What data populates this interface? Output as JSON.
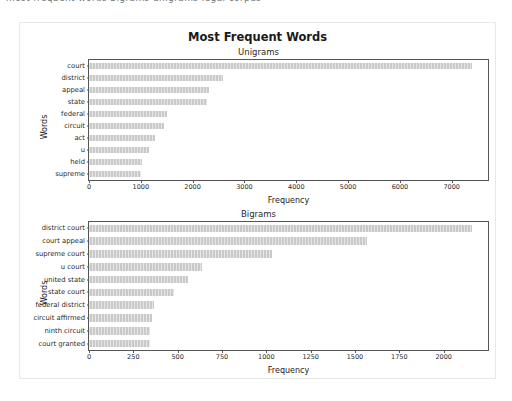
{
  "top_strip": {
    "clipped_text": "most frequent words bigrams unigrams legal corpus"
  },
  "figure": {
    "title": "Most Frequent Words",
    "background": "#ffffff",
    "border_color": "#e8e8e8",
    "bar_color": "#c9c9c9",
    "axis_color": "#555555"
  },
  "chart_data": [
    {
      "type": "bar",
      "orientation": "horizontal",
      "title": "Unigrams",
      "xlabel": "Frequency",
      "ylabel": "Words",
      "categories": [
        "court",
        "district",
        "appeal",
        "state",
        "federal",
        "circuit",
        "act",
        "u",
        "held",
        "supreme"
      ],
      "values": [
        7400,
        2580,
        2320,
        2280,
        1510,
        1450,
        1270,
        1160,
        1020,
        1010
      ],
      "xlim": [
        0,
        7700
      ],
      "xticks": [
        0,
        1000,
        2000,
        3000,
        4000,
        5000,
        6000,
        7000
      ],
      "xticklabels": [
        "0",
        "1000",
        "2000",
        "3000",
        "4000",
        "5000",
        "6000",
        "7000"
      ],
      "grid": false,
      "legend": "none"
    },
    {
      "type": "bar",
      "orientation": "horizontal",
      "title": "Bigrams",
      "xlabel": "Frequency",
      "ylabel": "Words",
      "categories": [
        "district court",
        "court appeal",
        "supreme court",
        "u court",
        "united state",
        "state court",
        "federal district",
        "circuit affirmed",
        "ninth circuit",
        "court granted"
      ],
      "values": [
        2160,
        1570,
        1030,
        640,
        560,
        480,
        365,
        355,
        345,
        345
      ],
      "xlim": [
        0,
        2250
      ],
      "xticks": [
        0,
        250,
        500,
        750,
        1000,
        1250,
        1500,
        1750,
        2000
      ],
      "xticklabels": [
        "0",
        "250",
        "500",
        "750",
        "1000",
        "1250",
        "1500",
        "1750",
        "2000"
      ],
      "grid": false,
      "legend": "none"
    }
  ]
}
